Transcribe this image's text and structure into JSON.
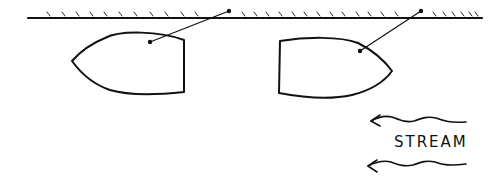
{
  "diagram": {
    "type": "illustration",
    "colors": {
      "ink": "#111111",
      "background": "#ffffff"
    },
    "bank": {
      "label": "",
      "y": 18,
      "x_start": 28,
      "x_end": 482
    },
    "boats": [
      {
        "id": "left-boat",
        "bow_direction": "left",
        "mooring_line": true
      },
      {
        "id": "right-boat",
        "bow_direction": "right",
        "mooring_line": true
      }
    ],
    "stream": {
      "label": "STREAM",
      "direction": "left",
      "arrows": 2
    }
  }
}
